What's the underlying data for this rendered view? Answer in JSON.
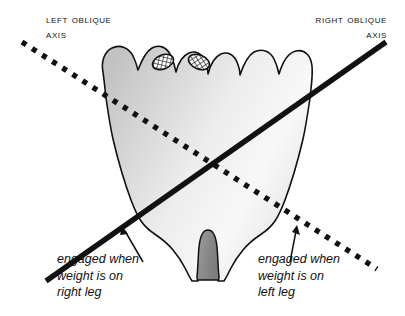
{
  "figure": {
    "background_color": "#ffffff",
    "line_color": "#111111"
  },
  "labels": {
    "left_axis": "Left Oblique\nAxis",
    "right_axis": "Right Oblique\nAxis"
  },
  "annotations": {
    "left": "engaged when\nweight is on\nright leg",
    "right": "engaged when\nweight is on\nleft leg"
  },
  "axes": [
    {
      "name": "left-oblique-axis",
      "style": "dotted",
      "color": "#111111",
      "from": [
        22,
        42
      ],
      "to": [
        377,
        269
      ],
      "label": "Left Oblique Axis",
      "engaged_when": "weight is on right leg"
    },
    {
      "name": "right-oblique-axis",
      "style": "solid",
      "color": "#111111",
      "from": [
        46,
        281
      ],
      "to": [
        386,
        42
      ],
      "label": "Right Oblique Axis",
      "engaged_when": "weight is on left leg"
    }
  ],
  "intersection_point": [
    208,
    158
  ],
  "anatomy": {
    "sacrum_fill_light": "#fdfdfd",
    "sacrum_fill_dark": "#c9c9c9",
    "coccyx_fill": "#8f8f8f",
    "facet_fill": "#ffffff",
    "facet_hatch_color": "#1a1a1a",
    "facet_count": 2,
    "outline_color": "#111111"
  },
  "pointers": [
    {
      "name": "pointer-left",
      "from": [
        143,
        262
      ],
      "to": [
        123,
        228
      ],
      "target": "right-oblique-axis"
    },
    {
      "name": "pointer-right",
      "from": [
        291,
        262
      ],
      "to": [
        297,
        228
      ],
      "target": "left-oblique-axis"
    }
  ]
}
